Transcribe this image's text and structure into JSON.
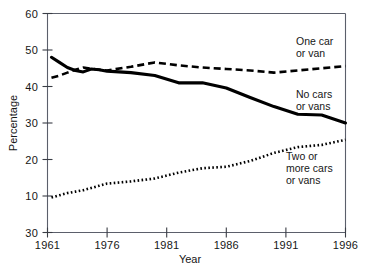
{
  "chart_data": {
    "type": "line",
    "title": "",
    "subtitle": "",
    "xlabel": "Year",
    "ylabel": "Percentage",
    "xlim": [
      1961,
      1996
    ],
    "ylim": [
      0,
      60
    ],
    "grid": false,
    "legend_position": "inline-right",
    "x_tick_labels": [
      "1961",
      "1976",
      "1981",
      "1986",
      "1991",
      "1996"
    ],
    "x_tick_values": [
      1961,
      1976,
      1981,
      1986,
      1991,
      1996
    ],
    "y_tick_labels": [
      "60",
      "50",
      "40",
      "30",
      "20",
      "10",
      "30"
    ],
    "y_tick_values": [
      60,
      50,
      40,
      30,
      20,
      10,
      0
    ],
    "x": [
      1962,
      1964,
      1966,
      1968,
      1970,
      1972,
      1974,
      1976,
      1978,
      1980,
      1982,
      1984,
      1986,
      1988,
      1990,
      1992,
      1994,
      1996
    ],
    "series": [
      {
        "name": "No cars or vans",
        "label": "No cars\nor vans",
        "style": "solid",
        "color": "#000000",
        "values": [
          48.0,
          46.6,
          45.2,
          44.4,
          44.0,
          44.8,
          44.6,
          44.2,
          43.8,
          43.0,
          41.0,
          41.0,
          39.6,
          37.0,
          34.5,
          32.4,
          32.2,
          30.0
        ]
      },
      {
        "name": "One car or van",
        "label": "One car\nor van",
        "style": "dashed",
        "color": "#000000",
        "values": [
          42.4,
          43.0,
          43.8,
          44.6,
          45.2,
          44.9,
          44.6,
          44.4,
          45.4,
          46.6,
          45.8,
          45.2,
          44.8,
          44.4,
          43.8,
          44.4,
          45.0,
          45.6
        ]
      },
      {
        "name": "Two or more cars or vans",
        "label": "Two or\nmore cars\nor vans",
        "style": "dotted",
        "color": "#000000",
        "values": [
          9.6,
          10.2,
          10.8,
          11.2,
          11.6,
          12.2,
          12.8,
          13.4,
          14.0,
          14.8,
          16.4,
          17.6,
          18.0,
          19.6,
          21.8,
          23.4,
          24.0,
          25.4
        ]
      }
    ],
    "annotations": [
      {
        "id": "label-one-car",
        "text_lines": [
          "One car",
          "or van"
        ],
        "x": 296,
        "y": 45
      },
      {
        "id": "label-no-cars",
        "text_lines": [
          "No cars",
          "or vans"
        ],
        "x": 296,
        "y": 98
      },
      {
        "id": "label-two-or-more",
        "text_lines": [
          "Two or",
          "more cars",
          "or vans"
        ],
        "x": 286,
        "y": 160
      }
    ]
  },
  "axes": {
    "y_title": "Percentage",
    "x_title": "Year"
  }
}
